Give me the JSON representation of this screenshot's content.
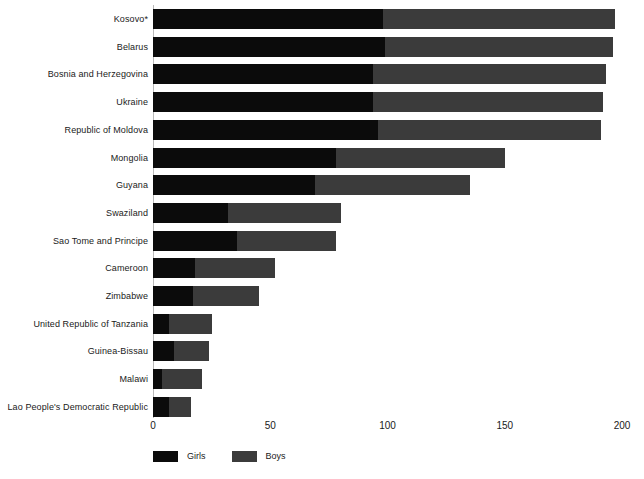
{
  "chart_data": {
    "type": "bar",
    "orientation": "horizontal",
    "stacked": true,
    "title": "",
    "subtitle": "",
    "xlabel": "",
    "ylabel": "",
    "xlim": [
      0,
      200
    ],
    "xticks": [
      0,
      50,
      100,
      150,
      200
    ],
    "xtick_labels": [
      "0",
      "50",
      "100",
      "150",
      "200"
    ],
    "grid": false,
    "legend_position": "bottom-left",
    "categories": [
      "Kosovo*",
      "Belarus",
      "Bosnia and Herzegovina",
      "Ukraine",
      "Republic of Moldova",
      "Mongolia",
      "Guyana",
      "Swaziland",
      "Sao Tome and Principe",
      "Cameroon",
      "Zimbabwe",
      "United Republic of Tanzania",
      "Guinea-Bissau",
      "Malawi",
      "Lao People's Democratic Republic"
    ],
    "series": [
      {
        "name": "Girls",
        "color": "#0b0b0b",
        "values": [
          98,
          99,
          94,
          94,
          96,
          78,
          69,
          32,
          36,
          18,
          17,
          7,
          9,
          4,
          7
        ]
      },
      {
        "name": "Boys",
        "color": "#3b3b3b",
        "values": [
          99,
          97,
          99,
          98,
          95,
          72,
          66,
          48,
          42,
          34,
          28,
          18,
          15,
          17,
          9
        ]
      }
    ],
    "totals": [
      197,
      196,
      193,
      192,
      191,
      150,
      135,
      80,
      78,
      52,
      45,
      25,
      24,
      21,
      16
    ]
  },
  "legend": {
    "items": [
      {
        "label": "Girls",
        "color": "#0b0b0b"
      },
      {
        "label": "Boys",
        "color": "#3b3b3b"
      }
    ]
  }
}
